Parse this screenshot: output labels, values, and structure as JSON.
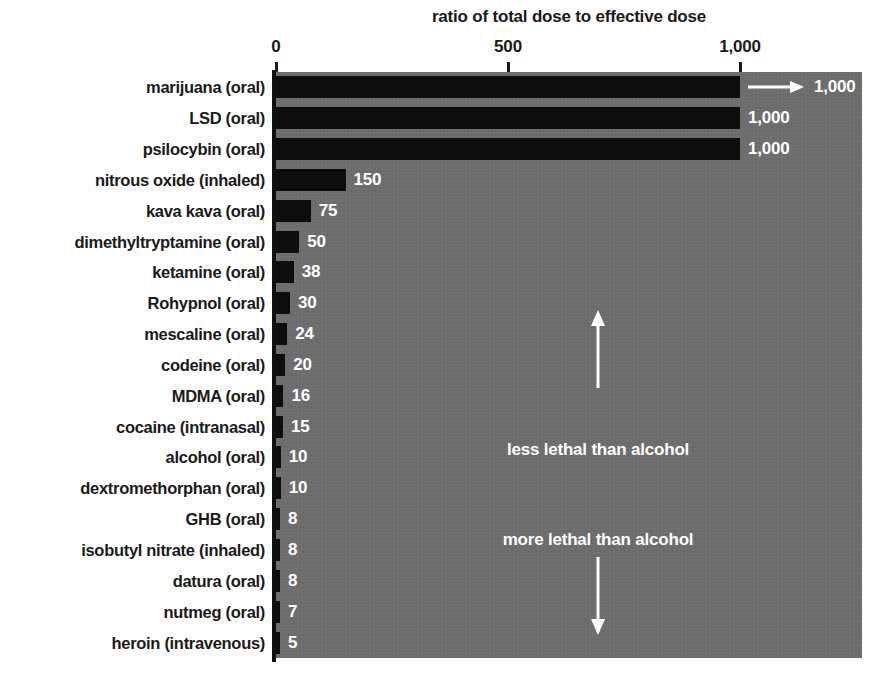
{
  "chart_data": {
    "type": "bar",
    "orientation": "horizontal",
    "title": "ratio of total dose to effective dose",
    "xlabel": "",
    "ylabel": "",
    "xlim": [
      0,
      1000
    ],
    "xticks": [
      0,
      500,
      1000
    ],
    "xtick_labels": [
      "0",
      "500",
      "1,000"
    ],
    "grid": false,
    "legend": null,
    "categories": [
      "marijuana (oral)",
      "LSD (oral)",
      "psilocybin (oral)",
      "nitrous oxide (inhaled)",
      "kava kava (oral)",
      "dimethyltryptamine (oral)",
      "ketamine (oral)",
      "Rohypnol (oral)",
      "mescaline (oral)",
      "codeine (oral)",
      "MDMA (oral)",
      "cocaine (intranasal)",
      "alcohol (oral)",
      "dextromethorphan (oral)",
      "GHB (oral)",
      "isobutyl nitrate (inhaled)",
      "datura (oral)",
      "nutmeg (oral)",
      "heroin (intravenous)"
    ],
    "values": [
      1000,
      1000,
      1000,
      150,
      75,
      50,
      38,
      30,
      24,
      20,
      16,
      15,
      10,
      10,
      8,
      8,
      8,
      7,
      5
    ],
    "value_labels": [
      "1,000",
      "1,000",
      "1,000",
      "150",
      "75",
      "50",
      "38",
      "30",
      "24",
      "20",
      "16",
      "15",
      "10",
      "10",
      "8",
      "8",
      "8",
      "7",
      "5"
    ],
    "overflow_flags": [
      true,
      false,
      false,
      false,
      false,
      false,
      false,
      false,
      false,
      false,
      false,
      false,
      false,
      false,
      false,
      false,
      false,
      false,
      false
    ],
    "annotations": [
      {
        "text": "less lethal than alcohol",
        "arrow": "up"
      },
      {
        "text": "more lethal than alcohol",
        "arrow": "down"
      }
    ],
    "colors": {
      "bar": "#0d0d0d",
      "plot_background": "#6e6e6e",
      "page_background": "#ffffff",
      "text_dark": "#1a1a1a",
      "text_light": "#ffffff",
      "axis": "#101010"
    }
  }
}
